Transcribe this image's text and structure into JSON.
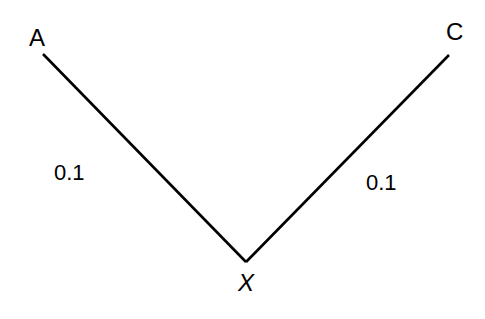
{
  "diagram": {
    "type": "tree",
    "nodes": [
      {
        "id": "A",
        "label": "A",
        "italic": false
      },
      {
        "id": "C",
        "label": "C",
        "italic": false
      },
      {
        "id": "X",
        "label": "X",
        "italic": true
      }
    ],
    "edges": [
      {
        "from": "X",
        "to": "A",
        "weight_label": "0.1"
      },
      {
        "from": "X",
        "to": "C",
        "weight_label": "0.1"
      }
    ],
    "colors": {
      "line": "#000000",
      "text": "#000000",
      "background": "#ffffff"
    }
  }
}
